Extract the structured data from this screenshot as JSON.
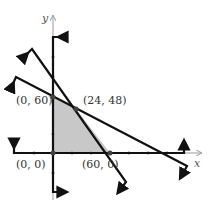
{
  "diagram": {
    "type": "feasible-region-graph",
    "axes": {
      "x_label": "x",
      "y_label": "y"
    },
    "vertices": [
      {
        "label": "(0, 60)",
        "x": 0,
        "y": 60
      },
      {
        "label": "(24, 48)",
        "x": 24,
        "y": 48
      },
      {
        "label": "(0, 0)",
        "x": 0,
        "y": 0
      },
      {
        "label": "(60, 0)",
        "x": 60,
        "y": 0
      }
    ],
    "boundary_lines": [
      {
        "name": "steep-line",
        "passes_through": [
          "(24, 48)",
          "(60, 0)"
        ]
      },
      {
        "name": "shallow-line",
        "passes_through": [
          "(0, 60)",
          "(24, 48)"
        ]
      },
      {
        "name": "y-axis-boundary",
        "x": 0
      },
      {
        "name": "x-axis-boundary",
        "y": 0
      }
    ],
    "shaded_region": "quadrilateral (0,0)-(0,60)-(24,48)-(60,0)",
    "colors": {
      "shade": "#c8c8c8",
      "line": "#111111",
      "axis": "#999999"
    }
  }
}
